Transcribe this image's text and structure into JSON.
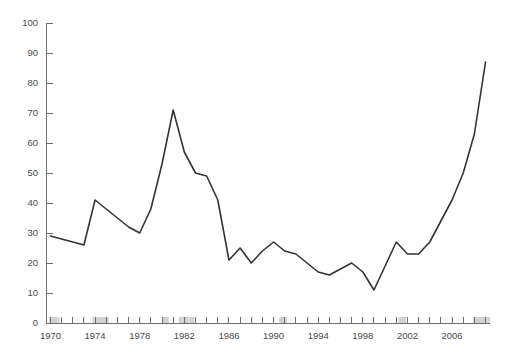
{
  "chart_data": {
    "type": "line",
    "title": "",
    "subtitle": "",
    "xlabel": "",
    "ylabel": "",
    "xlim": [
      1969.6,
      2009.4
    ],
    "ylim": [
      0,
      100
    ],
    "grid": false,
    "legend": false,
    "legend_position": "none",
    "y_ticks": [
      0,
      10,
      20,
      30,
      40,
      50,
      60,
      70,
      80,
      90,
      100
    ],
    "y_tick_labels": [
      "0",
      "10",
      "20",
      "30",
      "40",
      "50",
      "60",
      "70",
      "80",
      "90",
      "100"
    ],
    "x_tick_labels": [
      "1970",
      "1974",
      "1978",
      "1982",
      "1986",
      "1990",
      "1994",
      "1998",
      "2002",
      "2006"
    ],
    "x_labeled_years": [
      1970,
      1974,
      1978,
      1982,
      1986,
      1990,
      1994,
      1998,
      2002,
      2006
    ],
    "x_minor_years": [
      1970,
      1971,
      1972,
      1973,
      1974,
      1975,
      1976,
      1977,
      1978,
      1979,
      1980,
      1981,
      1982,
      1983,
      1984,
      1985,
      1986,
      1987,
      1988,
      1989,
      1990,
      1991,
      1992,
      1993,
      1994,
      1995,
      1996,
      1997,
      1998,
      1999,
      2000,
      2001,
      2002,
      2003,
      2004,
      2005,
      2006,
      2007,
      2008,
      2009
    ],
    "line_color": "#333333",
    "axis_color": "#6e6e6e",
    "band_color": "#d2d2d2",
    "recession_bands": [
      {
        "start": 1969.9,
        "end": 1970.8
      },
      {
        "start": 1973.8,
        "end": 1975.2
      },
      {
        "start": 1980.0,
        "end": 1980.6
      },
      {
        "start": 1981.5,
        "end": 1982.9
      },
      {
        "start": 1990.5,
        "end": 1991.2
      },
      {
        "start": 2001.2,
        "end": 2001.9
      },
      {
        "start": 2007.9,
        "end": 2009.4
      }
    ],
    "x": [
      1970,
      1971,
      1972,
      1973,
      1974,
      1975,
      1976,
      1977,
      1978,
      1979,
      1980,
      1981,
      1982,
      1983,
      1984,
      1985,
      1986,
      1987,
      1988,
      1989,
      1990,
      1991,
      1992,
      1993,
      1994,
      1995,
      1996,
      1997,
      1998,
      1999,
      2000,
      2001,
      2002,
      2003,
      2004,
      2005,
      2006,
      2007,
      2008,
      2009
    ],
    "values": [
      29,
      28,
      27,
      26,
      41,
      38,
      35,
      32,
      30,
      38,
      53,
      71,
      57,
      50,
      49,
      41,
      21,
      25,
      20,
      24,
      27,
      24,
      23,
      20,
      17,
      16,
      18,
      20,
      17,
      11,
      19,
      27,
      23,
      23,
      27,
      34,
      41,
      50,
      63,
      87
    ],
    "series": [
      {
        "name": "series-1",
        "values": [
          29,
          28,
          27,
          26,
          41,
          38,
          35,
          32,
          30,
          38,
          53,
          71,
          57,
          50,
          49,
          41,
          21,
          25,
          20,
          24,
          27,
          24,
          23,
          20,
          17,
          16,
          18,
          20,
          17,
          11,
          19,
          27,
          23,
          23,
          27,
          34,
          41,
          50,
          63,
          87
        ]
      }
    ]
  }
}
